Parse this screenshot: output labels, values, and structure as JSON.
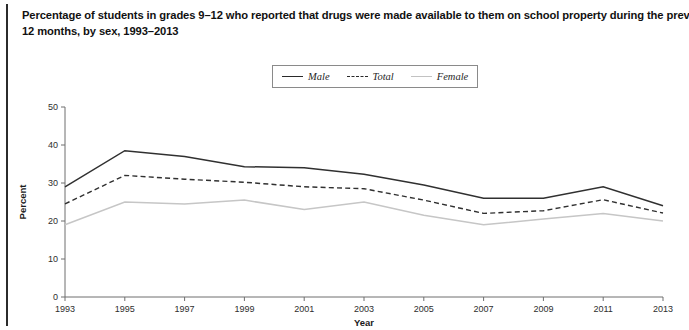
{
  "figure": {
    "title_line1": "Percentage of students in grades 9–12 who reported that drugs were made available to them on school property during the previous",
    "title_line2": "12 months, by sex, 1993–2013"
  },
  "legend": {
    "position": "top-center",
    "entries": [
      {
        "label": "Male",
        "style": "solid",
        "color": "#303030"
      },
      {
        "label": "Total",
        "style": "dashed",
        "color": "#303030"
      },
      {
        "label": "Female",
        "style": "solid",
        "color": "#c6c6c6"
      }
    ]
  },
  "chart_data": {
    "type": "line",
    "title": "Percentage of students in grades 9–12 who reported that drugs were made available to them on school property during the previous 12 months, by sex, 1993–2013",
    "xlabel": "Year",
    "ylabel": "Percent",
    "x": [
      1993,
      1995,
      1997,
      1999,
      2001,
      2003,
      2005,
      2007,
      2009,
      2011,
      2013
    ],
    "xtick_labels": [
      "1993",
      "1995",
      "1997",
      "1999",
      "2001",
      "2003",
      "2005",
      "2007",
      "2009",
      "2011",
      "2013"
    ],
    "xlim": [
      1993,
      2013
    ],
    "ylim": [
      0,
      50
    ],
    "yticks": [
      0,
      10,
      20,
      30,
      40,
      50
    ],
    "ytick_labels": [
      "0",
      "10",
      "20",
      "30",
      "40",
      "50"
    ],
    "grid": false,
    "legend_position": "top-center",
    "series": [
      {
        "name": "Male",
        "values": [
          29.0,
          38.5,
          37.0,
          34.3,
          34.0,
          32.3,
          29.5,
          26.0,
          26.0,
          29.0,
          24.0
        ]
      },
      {
        "name": "Total",
        "values": [
          24.5,
          32.0,
          31.0,
          30.2,
          29.0,
          28.5,
          25.5,
          22.0,
          22.7,
          25.6,
          22.1
        ]
      },
      {
        "name": "Female",
        "values": [
          19.0,
          25.0,
          24.5,
          25.5,
          23.0,
          25.0,
          21.5,
          19.0,
          20.5,
          22.0,
          20.0
        ]
      }
    ]
  }
}
